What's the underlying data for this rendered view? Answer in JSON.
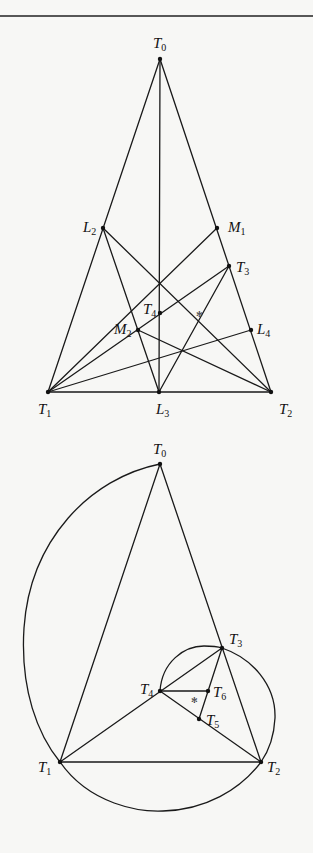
{
  "figure_top": {
    "title": "Triangle with cevians",
    "points": {
      "T0": {
        "label": "T",
        "sub": "0",
        "x": 160,
        "y": 59,
        "lx": 153,
        "ly": 48
      },
      "T1": {
        "label": "T",
        "sub": "1",
        "x": 48,
        "y": 392,
        "lx": 38,
        "ly": 414
      },
      "T2": {
        "label": "T",
        "sub": "2",
        "x": 271,
        "y": 392,
        "lx": 279,
        "ly": 414
      },
      "L3": {
        "label": "L",
        "sub": "3",
        "x": 159,
        "y": 392,
        "lx": 157,
        "ly": 414
      },
      "L2": {
        "label": "L",
        "sub": "2",
        "x": 103,
        "y": 228,
        "lx": 83,
        "ly": 232
      },
      "M1": {
        "label": "M",
        "sub": "1",
        "x": 217,
        "y": 228,
        "lx": 228,
        "ly": 232
      },
      "T3": {
        "label": "T",
        "sub": "3",
        "x": 229,
        "y": 266,
        "lx": 236,
        "ly": 272
      },
      "T4": {
        "label": "T",
        "sub": "4",
        "x": 160,
        "y": 313,
        "lx": 143,
        "ly": 314
      },
      "M2": {
        "label": "M",
        "sub": "2",
        "x": 138,
        "y": 330,
        "lx": 115,
        "ly": 334
      },
      "L4": {
        "label": "L",
        "sub": "4",
        "x": 251,
        "y": 330,
        "lx": 258,
        "ly": 334
      }
    },
    "marker": {
      "symbol": "✻",
      "x": 199,
      "y": 314
    }
  },
  "figure_bottom": {
    "title": "Triangle with circumscribing arcs",
    "points": {
      "T0": {
        "label": "T",
        "sub": "0",
        "x": 160,
        "y": 464,
        "lx": 153,
        "ly": 453
      },
      "T1": {
        "label": "T",
        "sub": "1",
        "x": 60,
        "y": 762,
        "lx": 39,
        "ly": 772
      },
      "T2": {
        "label": "T",
        "sub": "2",
        "x": 261,
        "y": 762,
        "lx": 267,
        "ly": 772
      },
      "T3": {
        "label": "T",
        "sub": "3",
        "x": 222,
        "y": 648,
        "lx": 229,
        "ly": 643
      },
      "T4": {
        "label": "T",
        "sub": "4",
        "x": 160,
        "y": 691,
        "lx": 140,
        "ly": 693
      },
      "T5": {
        "label": "T",
        "sub": "5",
        "x": 199,
        "y": 719,
        "lx": 207,
        "ly": 726
      },
      "T6": {
        "label": "T",
        "sub": "6",
        "x": 208,
        "y": 691,
        "lx": 213,
        "ly": 698
      }
    },
    "marker": {
      "symbol": "✻",
      "x": 194,
      "y": 700
    }
  }
}
